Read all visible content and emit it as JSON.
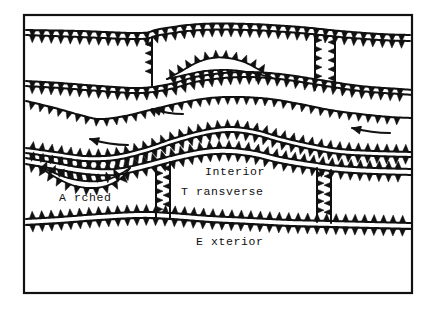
{
  "figure": {
    "background_color": "#ffffff",
    "ink_color": "#111111",
    "frame": {
      "x": 24,
      "y": 15,
      "width": 388,
      "height": 278,
      "stroke_width": 2.2
    }
  },
  "labels": {
    "interior": "Interior",
    "transverse": "T ransverse",
    "arched": "A rched",
    "exterior": "E xterior"
  },
  "tooth": {
    "spacing": 9.5,
    "height": 7.5,
    "width": 6.4,
    "vertical_spacing": 9.0,
    "vertical_height": 7.0,
    "vertical_width": 6.0
  },
  "faults": [
    {
      "name": "top-thrust-upper",
      "kind": "horizontal",
      "side": "down",
      "stroke": 2.0,
      "points": [
        [
          26,
          30
        ],
        [
          80,
          31
        ],
        [
          140,
          33
        ],
        [
          160,
          29
        ],
        [
          200,
          24
        ],
        [
          250,
          24
        ],
        [
          300,
          27
        ],
        [
          340,
          31
        ],
        [
          380,
          34
        ],
        [
          410,
          35
        ]
      ]
    },
    {
      "name": "top-thrust-lower",
      "kind": "horizontal",
      "side": "down",
      "stroke": 2.0,
      "points": [
        [
          26,
          35
        ],
        [
          80,
          37
        ],
        [
          140,
          39
        ],
        [
          160,
          35
        ],
        [
          200,
          30
        ],
        [
          250,
          30
        ],
        [
          300,
          33
        ],
        [
          340,
          37
        ],
        [
          380,
          40
        ],
        [
          410,
          41
        ]
      ]
    },
    {
      "name": "upper-block-divider-left",
      "kind": "vertical",
      "side": "right",
      "stroke": 2.0,
      "points": [
        [
          152,
          38
        ],
        [
          152,
          60
        ],
        [
          152,
          80
        ],
        [
          152,
          86
        ]
      ]
    },
    {
      "name": "upper-block-divider-right",
      "kind": "vertical",
      "side": "left",
      "stroke": 2.0,
      "points": [
        [
          315,
          34
        ],
        [
          315,
          60
        ],
        [
          315,
          80
        ],
        [
          315,
          90
        ]
      ]
    },
    {
      "name": "upper-block-divider-right2",
      "kind": "vertical",
      "side": "right",
      "stroke": 2.0,
      "points": [
        [
          335,
          36
        ],
        [
          335,
          60
        ],
        [
          335,
          80
        ],
        [
          335,
          88
        ]
      ]
    },
    {
      "name": "second-thrust-upper",
      "kind": "horizontal",
      "side": "down",
      "stroke": 2.0,
      "points": [
        [
          26,
          81
        ],
        [
          60,
          83
        ],
        [
          100,
          86
        ],
        [
          140,
          88
        ],
        [
          170,
          84
        ],
        [
          200,
          76
        ],
        [
          240,
          72
        ],
        [
          280,
          74
        ],
        [
          320,
          80
        ],
        [
          360,
          86
        ],
        [
          400,
          89
        ],
        [
          412,
          90
        ]
      ]
    },
    {
      "name": "second-thrust-lower",
      "kind": "horizontal",
      "side": "down",
      "stroke": 2.0,
      "points": [
        [
          26,
          86
        ],
        [
          60,
          88
        ],
        [
          100,
          91
        ],
        [
          140,
          93
        ],
        [
          170,
          89
        ],
        [
          200,
          81
        ],
        [
          240,
          77
        ],
        [
          280,
          79
        ],
        [
          320,
          85
        ],
        [
          360,
          91
        ],
        [
          400,
          94
        ],
        [
          412,
          95
        ]
      ]
    },
    {
      "name": "upper-arch-lens-top",
      "kind": "horizontal",
      "side": "up",
      "stroke": 1.8,
      "points": [
        [
          167,
          79
        ],
        [
          180,
          72
        ],
        [
          196,
          63
        ],
        [
          212,
          58
        ],
        [
          228,
          58
        ],
        [
          244,
          62
        ],
        [
          256,
          68
        ],
        [
          266,
          74
        ],
        [
          272,
          78
        ]
      ]
    },
    {
      "name": "upper-arch-lens-bottom",
      "kind": "horizontal",
      "side": "down",
      "stroke": 1.8,
      "points": [
        [
          167,
          79
        ],
        [
          185,
          75
        ],
        [
          205,
          71
        ],
        [
          228,
          70
        ],
        [
          248,
          72
        ],
        [
          262,
          75
        ],
        [
          272,
          78
        ]
      ]
    },
    {
      "name": "third-thrust",
      "kind": "horizontal",
      "side": "down",
      "stroke": 2.0,
      "points": [
        [
          26,
          101
        ],
        [
          55,
          108
        ],
        [
          80,
          115
        ],
        [
          100,
          119
        ],
        [
          125,
          116
        ],
        [
          150,
          110
        ],
        [
          180,
          103
        ],
        [
          210,
          98
        ],
        [
          240,
          97
        ],
        [
          270,
          99
        ],
        [
          300,
          104
        ],
        [
          330,
          110
        ],
        [
          360,
          114
        ],
        [
          390,
          117
        ],
        [
          412,
          118
        ]
      ]
    },
    {
      "name": "fourth-thrust-upper",
      "kind": "horizontal",
      "side": "up",
      "stroke": 2.0,
      "points": [
        [
          26,
          148
        ],
        [
          55,
          152
        ],
        [
          85,
          156
        ],
        [
          115,
          155
        ],
        [
          145,
          148
        ],
        [
          175,
          138
        ],
        [
          205,
          130
        ],
        [
          230,
          127
        ],
        [
          255,
          130
        ],
        [
          280,
          137
        ],
        [
          310,
          144
        ],
        [
          340,
          149
        ],
        [
          375,
          151
        ],
        [
          412,
          152
        ]
      ]
    },
    {
      "name": "fourth-thrust-lower",
      "kind": "horizontal",
      "side": "down",
      "stroke": 2.0,
      "points": [
        [
          26,
          153
        ],
        [
          55,
          157
        ],
        [
          85,
          161
        ],
        [
          115,
          160
        ],
        [
          145,
          153
        ],
        [
          175,
          143
        ],
        [
          205,
          135
        ],
        [
          230,
          132
        ],
        [
          255,
          135
        ],
        [
          280,
          142
        ],
        [
          310,
          149
        ],
        [
          340,
          154
        ],
        [
          375,
          156
        ],
        [
          412,
          157
        ]
      ]
    },
    {
      "name": "fifth-thrust-upper",
      "kind": "horizontal",
      "side": "up",
      "stroke": 2.0,
      "points": [
        [
          26,
          158
        ],
        [
          55,
          163
        ],
        [
          85,
          168
        ],
        [
          115,
          169
        ],
        [
          145,
          163
        ],
        [
          175,
          155
        ],
        [
          205,
          149
        ],
        [
          230,
          148
        ],
        [
          255,
          151
        ],
        [
          280,
          157
        ],
        [
          310,
          162
        ],
        [
          340,
          166
        ],
        [
          375,
          168
        ],
        [
          412,
          169
        ]
      ]
    },
    {
      "name": "fifth-thrust-lower",
      "kind": "horizontal",
      "side": "down",
      "stroke": 2.0,
      "points": [
        [
          26,
          164
        ],
        [
          55,
          169
        ],
        [
          85,
          174
        ],
        [
          115,
          175
        ],
        [
          145,
          169
        ],
        [
          175,
          161
        ],
        [
          205,
          155
        ],
        [
          230,
          154
        ],
        [
          255,
          157
        ],
        [
          280,
          163
        ],
        [
          310,
          168
        ],
        [
          340,
          172
        ],
        [
          375,
          174
        ],
        [
          412,
          175
        ]
      ]
    },
    {
      "name": "arched-lens-top",
      "kind": "horizontal",
      "side": "up",
      "stroke": 1.8,
      "points": [
        [
          38,
          166
        ],
        [
          52,
          172
        ],
        [
          68,
          178
        ],
        [
          85,
          181
        ],
        [
          100,
          181
        ],
        [
          112,
          178
        ],
        [
          122,
          173
        ],
        [
          130,
          168
        ]
      ]
    },
    {
      "name": "arched-lens-bottom",
      "kind": "horizontal",
      "side": "down",
      "stroke": 1.8,
      "points": [
        [
          38,
          166
        ],
        [
          55,
          177
        ],
        [
          72,
          185
        ],
        [
          90,
          188
        ],
        [
          106,
          186
        ],
        [
          120,
          179
        ],
        [
          130,
          168
        ]
      ]
    },
    {
      "name": "lower-block-divider-left",
      "kind": "vertical",
      "side": "left",
      "stroke": 2.0,
      "points": [
        [
          156,
          167
        ],
        [
          156,
          190
        ],
        [
          156,
          210
        ],
        [
          156,
          218
        ]
      ]
    },
    {
      "name": "lower-block-divider-mid",
      "kind": "vertical",
      "side": "right",
      "stroke": 2.0,
      "points": [
        [
          170,
          162
        ],
        [
          170,
          190
        ],
        [
          170,
          210
        ],
        [
          170,
          218
        ]
      ]
    },
    {
      "name": "lower-block-divider-right",
      "kind": "vertical",
      "side": "left",
      "stroke": 2.0,
      "points": [
        [
          317,
          168
        ],
        [
          317,
          190
        ],
        [
          317,
          210
        ],
        [
          317,
          222
        ]
      ]
    },
    {
      "name": "lower-block-divider-right2",
      "kind": "vertical",
      "side": "right",
      "stroke": 2.0,
      "points": [
        [
          331,
          170
        ],
        [
          331,
          190
        ],
        [
          331,
          210
        ],
        [
          331,
          223
        ]
      ]
    },
    {
      "name": "basal-thrust-upper",
      "kind": "horizontal",
      "side": "up",
      "stroke": 2.0,
      "points": [
        [
          26,
          219
        ],
        [
          60,
          217
        ],
        [
          100,
          214
        ],
        [
          140,
          212
        ],
        [
          170,
          213
        ],
        [
          210,
          216
        ],
        [
          250,
          218
        ],
        [
          290,
          220
        ],
        [
          330,
          221
        ],
        [
          370,
          222
        ],
        [
          412,
          223
        ]
      ]
    },
    {
      "name": "basal-thrust-lower",
      "kind": "horizontal",
      "side": "down",
      "stroke": 2.2,
      "points": [
        [
          26,
          225
        ],
        [
          60,
          223
        ],
        [
          100,
          220
        ],
        [
          140,
          218
        ],
        [
          170,
          219
        ],
        [
          210,
          222
        ],
        [
          250,
          224
        ],
        [
          290,
          226
        ],
        [
          330,
          227
        ],
        [
          370,
          228
        ],
        [
          412,
          229
        ]
      ]
    }
  ],
  "arrows": [
    {
      "name": "transport-arrow-upper-mid",
      "tail": [
        183,
        114
      ],
      "head": [
        152,
        109
      ],
      "curve": [
        168,
        114
      ]
    },
    {
      "name": "transport-arrow-lower-left",
      "tail": [
        128,
        145
      ],
      "head": [
        90,
        139
      ],
      "curve": [
        110,
        145
      ]
    },
    {
      "name": "transport-arrow-right",
      "tail": [
        390,
        133
      ],
      "head": [
        352,
        128
      ],
      "curve": [
        372,
        133
      ]
    }
  ]
}
